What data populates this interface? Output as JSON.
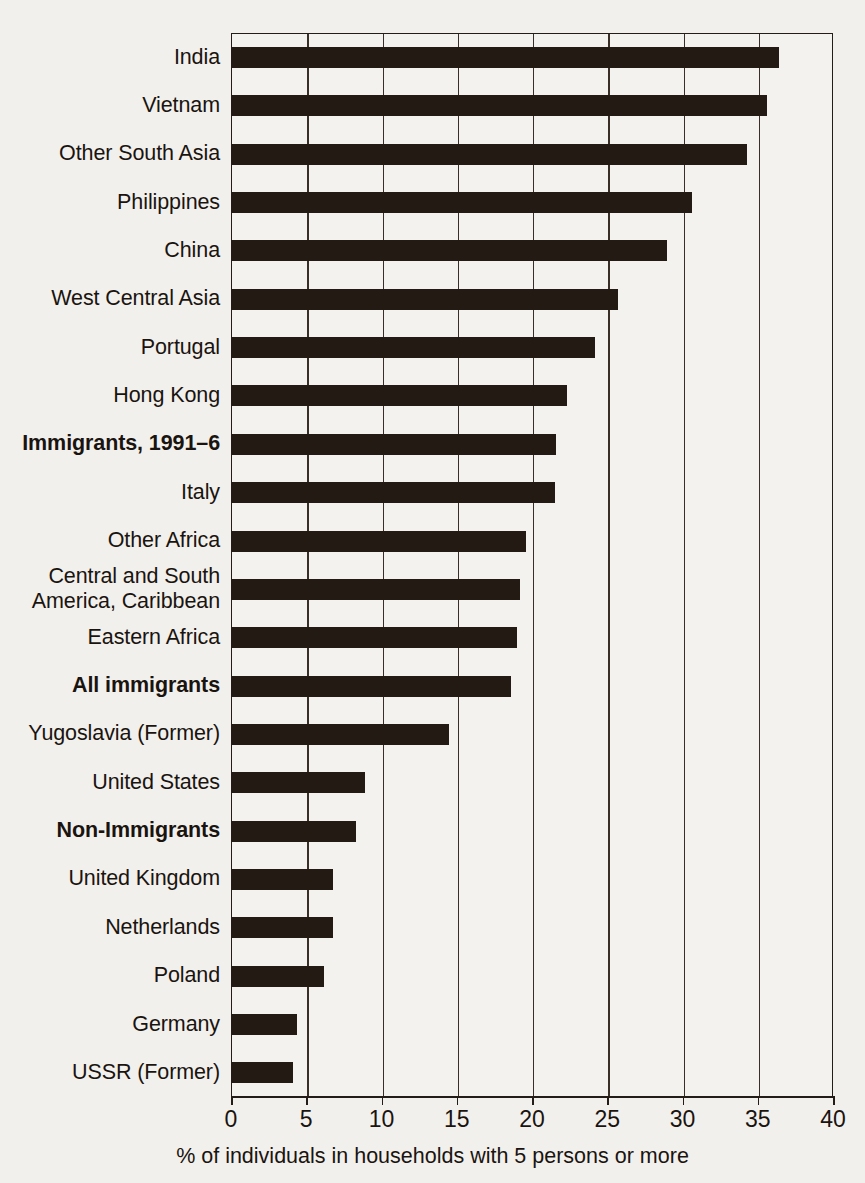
{
  "chart_data": {
    "type": "bar",
    "orientation": "horizontal",
    "title": "",
    "xlabel": "% of individuals in households with 5 persons or more",
    "ylabel": "",
    "xlim": [
      0,
      40
    ],
    "xticks": [
      0,
      5,
      10,
      15,
      20,
      25,
      30,
      35,
      40
    ],
    "xtick_labels": [
      "0",
      "5",
      "10",
      "15",
      "20",
      "25",
      "30",
      "35",
      "40"
    ],
    "grid": "vertical",
    "legend": "none",
    "bar_color": "#231a14",
    "background_color": "#f2f0ec",
    "categories": [
      "India",
      "Vietnam",
      "Other South Asia",
      "Philippines",
      "China",
      "West Central Asia",
      "Portugal",
      "Hong Kong",
      "Immigrants, 1991–6",
      "Italy",
      "Other Africa",
      "Central and South\nAmerica, Caribbean",
      "Eastern Africa",
      "All immigrants",
      "Yugoslavia (Former)",
      "United States",
      "Non-Immigrants",
      "United Kingdom",
      "Netherlands",
      "Poland",
      "Germany",
      "USSR (Former)"
    ],
    "values": [
      36.4,
      35.6,
      34.3,
      30.6,
      29.0,
      25.7,
      24.2,
      22.3,
      21.6,
      21.5,
      19.6,
      19.2,
      19.0,
      18.6,
      14.5,
      8.9,
      8.3,
      6.8,
      6.8,
      6.2,
      4.4,
      4.1
    ],
    "emphasized_categories": [
      "Immigrants, 1991–6",
      "All immigrants",
      "Non-Immigrants"
    ]
  }
}
